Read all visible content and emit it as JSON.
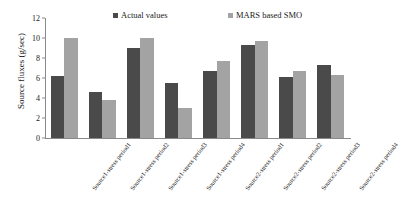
{
  "chart_data": {
    "type": "bar",
    "title": "",
    "xlabel": "",
    "ylabel": "Source fluxes (g/sec)",
    "ylim": [
      0,
      12
    ],
    "yticks": [
      0,
      2,
      4,
      6,
      8,
      10,
      12
    ],
    "grid": false,
    "legend_position": "top",
    "categories": [
      "Source1-stress period1",
      "Source1-stress period2",
      "Source1-stress period3",
      "Source1-stress period4",
      "Source2-stress period1",
      "Source2-stress period2",
      "Source2-stress period3",
      "Source2-stress period4"
    ],
    "series": [
      {
        "name": "Actual values",
        "color": "#4a4a4a",
        "values": [
          6.2,
          4.6,
          9.05,
          5.55,
          6.7,
          9.35,
          6.15,
          7.3
        ]
      },
      {
        "name": "MARS based SMO",
        "color": "#a3a3a3",
        "values": [
          10.0,
          3.8,
          10.0,
          3.0,
          7.7,
          9.7,
          6.75,
          6.3
        ]
      }
    ]
  },
  "axis": {
    "tick_labels": [
      "0",
      "2",
      "4",
      "6",
      "8",
      "10",
      "12"
    ]
  }
}
